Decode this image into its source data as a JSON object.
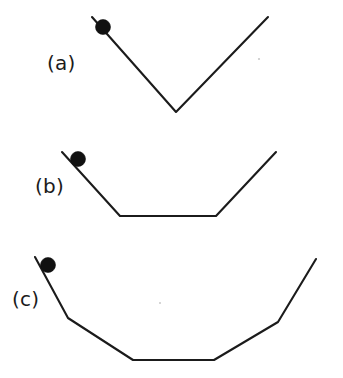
{
  "figure": {
    "background_color": "#ffffff",
    "line_color": "#1b1b1b",
    "ball_color": "#111111",
    "width": 343,
    "height": 378
  },
  "panels": [
    {
      "id": "a",
      "label": "(a)",
      "label_x": 47,
      "label_y": 70,
      "description": "Narrow V-shaped track with a single sharp vertex",
      "path": "M 92,17 L 176,112 L 268,17",
      "vertices": [
        [
          92,
          17
        ],
        [
          176,
          112
        ],
        [
          268,
          17
        ]
      ],
      "ball": {
        "cx": 103,
        "cy": 27,
        "r": 7.5
      }
    },
    {
      "id": "b",
      "label": "(b)",
      "label_x": 35,
      "label_y": 193,
      "description": "Trapezoidal track with a flat bottom segment",
      "path": "M 62,152 L 120,216 L 216,216 L 276,152",
      "vertices": [
        [
          62,
          152
        ],
        [
          120,
          216
        ],
        [
          216,
          216
        ],
        [
          276,
          152
        ]
      ],
      "ball": {
        "cx": 78,
        "cy": 159,
        "r": 7.5
      }
    },
    {
      "id": "c",
      "label": "(c)",
      "label_x": 12,
      "label_y": 306,
      "description": "Wide multi-segment bowl track with a long flat bottom",
      "path": "M 35,257 L 68,318 L 133,360 L 214,360 L 278,322 L 316,259",
      "vertices": [
        [
          35,
          257
        ],
        [
          68,
          318
        ],
        [
          133,
          360
        ],
        [
          214,
          360
        ],
        [
          278,
          322
        ],
        [
          316,
          259
        ]
      ],
      "ball": {
        "cx": 48,
        "cy": 265,
        "r": 7.5
      }
    }
  ]
}
